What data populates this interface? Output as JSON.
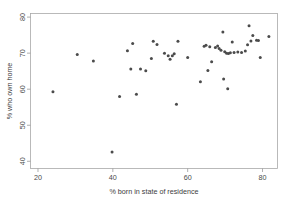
{
  "chart_data": {
    "type": "scatter",
    "title": "",
    "xlabel": "% born in state of residence",
    "ylabel": "% who own home",
    "xlim": [
      18,
      84
    ],
    "ylim": [
      38,
      81
    ],
    "xticks": [
      20,
      40,
      60,
      80
    ],
    "yticks": [
      40,
      50,
      60,
      70,
      80
    ],
    "xtick_labels": [
      "20",
      "40",
      "60",
      "80"
    ],
    "ytick_labels": [
      "40",
      "50",
      "60",
      "70",
      "80"
    ],
    "grid": false,
    "legend": false,
    "marker_color": "#4b4b4b",
    "marker_size": 1.5,
    "frame_color": "#a8a8a8",
    "background": "#ffffff",
    "points": [
      {
        "x": 24.0,
        "y": 59.3
      },
      {
        "x": 30.5,
        "y": 69.6
      },
      {
        "x": 34.8,
        "y": 67.8
      },
      {
        "x": 39.8,
        "y": 42.6
      },
      {
        "x": 41.8,
        "y": 58.0
      },
      {
        "x": 43.9,
        "y": 70.7
      },
      {
        "x": 44.8,
        "y": 65.6
      },
      {
        "x": 45.3,
        "y": 72.7
      },
      {
        "x": 46.3,
        "y": 58.6
      },
      {
        "x": 47.4,
        "y": 65.6
      },
      {
        "x": 48.8,
        "y": 65.1
      },
      {
        "x": 50.3,
        "y": 68.5
      },
      {
        "x": 50.8,
        "y": 73.3
      },
      {
        "x": 51.8,
        "y": 72.4
      },
      {
        "x": 53.8,
        "y": 70.0
      },
      {
        "x": 54.8,
        "y": 69.3
      },
      {
        "x": 55.3,
        "y": 68.3
      },
      {
        "x": 55.9,
        "y": 69.3
      },
      {
        "x": 56.4,
        "y": 69.8
      },
      {
        "x": 57.0,
        "y": 55.8
      },
      {
        "x": 57.4,
        "y": 73.3
      },
      {
        "x": 60.0,
        "y": 68.8
      },
      {
        "x": 63.4,
        "y": 62.1
      },
      {
        "x": 64.4,
        "y": 71.9
      },
      {
        "x": 64.9,
        "y": 72.2
      },
      {
        "x": 65.4,
        "y": 65.2
      },
      {
        "x": 65.9,
        "y": 71.8
      },
      {
        "x": 66.4,
        "y": 67.6
      },
      {
        "x": 67.4,
        "y": 71.6
      },
      {
        "x": 68.0,
        "y": 72.0
      },
      {
        "x": 68.4,
        "y": 71.3
      },
      {
        "x": 68.9,
        "y": 70.8
      },
      {
        "x": 69.4,
        "y": 75.9
      },
      {
        "x": 69.6,
        "y": 62.8
      },
      {
        "x": 69.9,
        "y": 70.4
      },
      {
        "x": 70.4,
        "y": 70.0
      },
      {
        "x": 70.7,
        "y": 60.1
      },
      {
        "x": 70.9,
        "y": 69.9
      },
      {
        "x": 71.4,
        "y": 70.1
      },
      {
        "x": 71.9,
        "y": 73.1
      },
      {
        "x": 72.4,
        "y": 70.2
      },
      {
        "x": 73.4,
        "y": 70.3
      },
      {
        "x": 74.4,
        "y": 70.2
      },
      {
        "x": 75.4,
        "y": 70.6
      },
      {
        "x": 76.0,
        "y": 72.3
      },
      {
        "x": 76.4,
        "y": 77.6
      },
      {
        "x": 76.9,
        "y": 73.4
      },
      {
        "x": 77.4,
        "y": 74.9
      },
      {
        "x": 78.4,
        "y": 73.6
      },
      {
        "x": 78.9,
        "y": 73.5
      },
      {
        "x": 79.4,
        "y": 68.8
      },
      {
        "x": 81.7,
        "y": 74.6
      }
    ]
  }
}
